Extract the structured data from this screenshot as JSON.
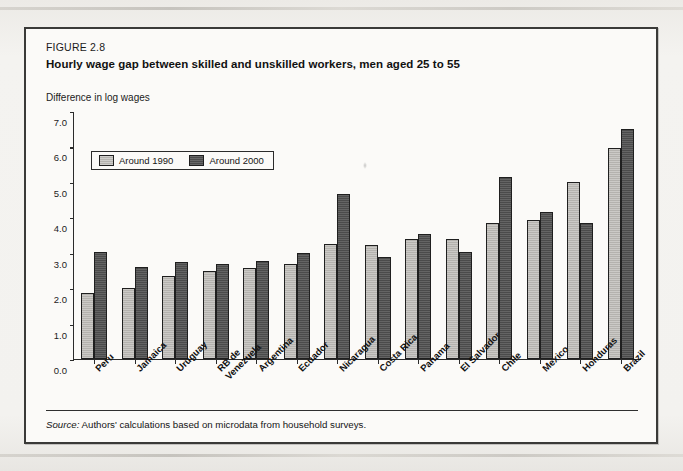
{
  "figure": {
    "label": "FIGURE 2.8",
    "title": "Hourly wage gap between skilled and unskilled workers, men aged 25 to 55",
    "axis_caption": "Difference in log wages",
    "source_prefix": "Source:",
    "source_text": "Authors' calculations based on microdata from household surveys."
  },
  "legend": {
    "items": [
      {
        "label": "Around 1990",
        "color": "#b4b2ae"
      },
      {
        "label": "Around 2000",
        "color": "#4b4b4b"
      }
    ]
  },
  "chart_data": {
    "type": "bar",
    "title": "Hourly wage gap between skilled and unskilled workers, men aged 25 to 55",
    "xlabel": "",
    "ylabel": "Difference in log wages",
    "ylim": [
      0.0,
      7.0
    ],
    "yticks": [
      "0.0",
      "1.0",
      "2.0",
      "3.0",
      "4.0",
      "5.0",
      "6.0",
      "7.0"
    ],
    "grid": false,
    "legend_position": "top-left",
    "categories": [
      "Peru",
      "Jamaica",
      "Uruguay",
      "RB de\nVenezuela",
      "Argentina",
      "Ecuador",
      "Nicaragua",
      "Costa Rica",
      "Panama",
      "El Salvador",
      "Chile",
      "Mexico",
      "Honduras",
      "Brazil"
    ],
    "series": [
      {
        "name": "Around 1990",
        "color": "#b4b2ae",
        "values": [
          1.87,
          2.0,
          2.35,
          2.48,
          2.56,
          2.67,
          3.25,
          3.22,
          3.38,
          3.4,
          3.85,
          3.93,
          5.0,
          5.95
        ]
      },
      {
        "name": "Around 2000",
        "color": "#4b4b4b",
        "values": [
          3.03,
          2.6,
          2.75,
          2.68,
          2.77,
          2.98,
          4.67,
          2.88,
          3.52,
          3.02,
          5.15,
          4.15,
          3.85,
          6.48
        ]
      }
    ]
  }
}
